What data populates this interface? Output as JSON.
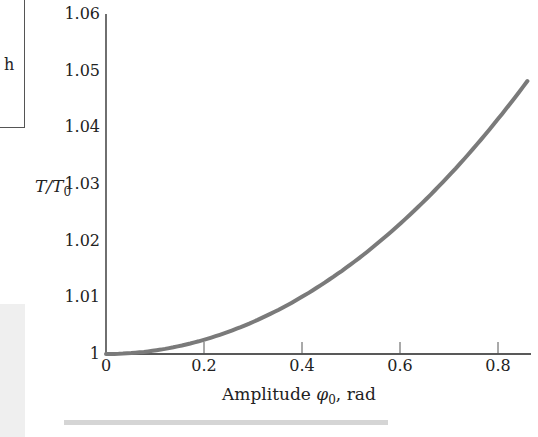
{
  "side_panel": {
    "visible_text": "h"
  },
  "chart_data": {
    "type": "line",
    "title": "",
    "xlabel": "Amplitude φ0, rad",
    "ylabel": "T/T0",
    "x_ticks": [
      "0",
      "0.2",
      "0.4",
      "0.6",
      "0.8"
    ],
    "y_ticks": [
      "1",
      "1.01",
      "1.02",
      "1.03",
      "1.04",
      "1.05",
      "1.06"
    ],
    "xlim": [
      0,
      0.86
    ],
    "ylim": [
      1,
      1.06
    ],
    "grid": false,
    "legend": null,
    "series": [
      {
        "name": "T/T0",
        "color": "#7a7a7a",
        "x": [
          0,
          0.1,
          0.2,
          0.3,
          0.4,
          0.5,
          0.6,
          0.7,
          0.8,
          0.86
        ],
        "y": [
          1.0,
          1.0006,
          1.0025,
          1.0057,
          1.0101,
          1.0158,
          1.023,
          1.0315,
          1.0415,
          1.048
        ]
      }
    ]
  },
  "labels": {
    "ylabel_main": "T/T",
    "ylabel_sub": "0",
    "xlabel_pre": "Amplitude ",
    "xlabel_phi": "φ",
    "xlabel_sub": "0",
    "xlabel_post": ", rad"
  }
}
